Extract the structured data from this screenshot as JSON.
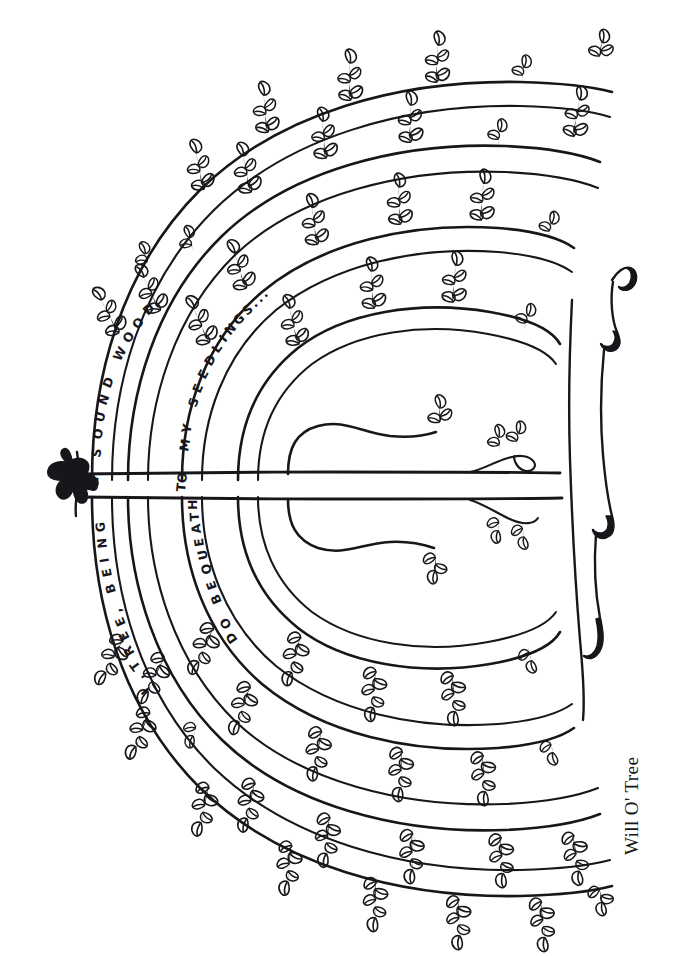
{
  "artwork": {
    "title": "Will O' Tree",
    "caption": "Will O' Tree",
    "medium": "pen-and-ink line drawing",
    "background_color": "#ffffff",
    "ink_color": "#17161a"
  },
  "inscription": {
    "full_text": "I, TREE, BEING OF SOUND WOOD, DO BEQUEATH TO MY SEEDLINGS...",
    "segments": [
      {
        "id": "seg-outer-lower",
        "text": "I, TREE, BEING",
        "arc": "outer-left-lower",
        "direction": "bottom-to-top"
      },
      {
        "id": "seg-outer-joint",
        "text": "OF",
        "arc": "outer-left-trunk-gap",
        "direction": "upright-rotated"
      },
      {
        "id": "seg-outer-upper",
        "text": "SOUND WOOD",
        "arc": "outer-left-upper",
        "direction": "bottom-to-top"
      },
      {
        "id": "seg-inner-lower",
        "text": "DO BEQUEATH",
        "arc": "inner-left-lower",
        "direction": "bottom-to-top"
      },
      {
        "id": "seg-inner-joint",
        "text": "TO",
        "arc": "inner-left-trunk-gap",
        "direction": "upright-rotated"
      },
      {
        "id": "seg-inner-upper",
        "text": "MY SEEDLINGS...",
        "arc": "inner-left-upper",
        "direction": "bottom-to-top"
      }
    ]
  },
  "letters": {
    "sound_wood": [
      "S",
      "O",
      "U",
      "N",
      "D",
      " ",
      "W",
      "O",
      "O",
      "D"
    ],
    "my_seedlings": [
      "M",
      "Y",
      " ",
      "S",
      "E",
      "E",
      "D",
      "L",
      "I",
      "N",
      "G",
      "S",
      ".",
      ".",
      "."
    ],
    "i_tree_being": [
      "I",
      ",",
      "T",
      "R",
      "E",
      "E",
      ",",
      " ",
      "B",
      "E",
      "I",
      "N",
      "G"
    ],
    "do_bequeath": [
      "D",
      "O",
      " ",
      "B",
      "E",
      "Q",
      "U",
      "E",
      "A",
      "T",
      "H"
    ],
    "of": "OF",
    "to": "TO"
  },
  "elements": {
    "trunk_label": "horizontal double-line trunk",
    "left_flourish_label": "calligraphic fleuron",
    "right_flourish_label": "calligraphic scroll edge",
    "leaf_sprig_label": "leaf sprig",
    "branch_label": "branch"
  }
}
